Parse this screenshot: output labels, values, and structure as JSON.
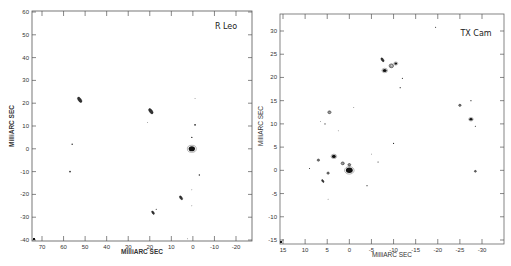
{
  "chart_data": [
    {
      "type": "scatter",
      "title": "R Leo",
      "xlabel": "MilliARC SEC",
      "ylabel": "MilliARC SEC",
      "xlim": [
        75,
        -27
      ],
      "ylim": [
        -41,
        61
      ],
      "xticks": [
        70,
        60,
        50,
        40,
        30,
        20,
        10,
        0,
        -10,
        -20
      ],
      "yticks": [
        60,
        50,
        40,
        30,
        20,
        10,
        0,
        -10,
        -20,
        -30,
        -40
      ],
      "grid": false,
      "legend": null,
      "features": [
        {
          "x": 52.5,
          "y": 21.5,
          "size": 2.2,
          "shape": "elongated"
        },
        {
          "x": 19.5,
          "y": 16.5,
          "size": 2.2,
          "shape": "elongated"
        },
        {
          "x": 0.5,
          "y": 0,
          "size": 3.2,
          "shape": "blob"
        },
        {
          "x": -1,
          "y": 10.5,
          "size": 1.2,
          "shape": "dot"
        },
        {
          "x": 0.5,
          "y": 5,
          "size": 1.0,
          "shape": "dot"
        },
        {
          "x": -3,
          "y": -11.5,
          "size": 1.0,
          "shape": "dot"
        },
        {
          "x": 56,
          "y": 2,
          "size": 1.0,
          "shape": "dot"
        },
        {
          "x": 57,
          "y": -10,
          "size": 1.2,
          "shape": "dot"
        },
        {
          "x": 5.5,
          "y": -21.5,
          "size": 1.6,
          "shape": "elongated"
        },
        {
          "x": 18.5,
          "y": -28,
          "size": 1.4,
          "shape": "elongated"
        },
        {
          "x": 17,
          "y": -26.5,
          "size": 0.8,
          "shape": "dot"
        },
        {
          "x": -1,
          "y": 22,
          "size": 0.6,
          "shape": "dot"
        },
        {
          "x": 0.5,
          "y": -18,
          "size": 0.6,
          "shape": "dot"
        },
        {
          "x": 0.5,
          "y": -25,
          "size": 0.6,
          "shape": "dot"
        },
        {
          "x": 2.5,
          "y": -39.5,
          "size": 0.6,
          "shape": "dot"
        },
        {
          "x": 21,
          "y": 11.5,
          "size": 0.6,
          "shape": "dot"
        }
      ]
    },
    {
      "type": "scatter",
      "title": "TX Cam",
      "xlabel": "MilliARC SEC",
      "ylabel": "MilliARC SEC",
      "xlim": [
        15.5,
        -35
      ],
      "ylim": [
        -16,
        34
      ],
      "xticks": [
        15,
        10,
        5,
        0,
        -5,
        -10,
        -15,
        -20,
        -25,
        -30
      ],
      "yticks": [
        30,
        25,
        20,
        15,
        10,
        5,
        0,
        -5,
        -10,
        -15
      ],
      "grid": false,
      "legend": null,
      "features": [
        {
          "x": -9.5,
          "y": 22.5,
          "size": 2.2,
          "shape": "ring"
        },
        {
          "x": -8,
          "y": 21.5,
          "size": 2.0,
          "shape": "blob"
        },
        {
          "x": -7.5,
          "y": 23.8,
          "size": 1.6,
          "shape": "elongated"
        },
        {
          "x": -10.5,
          "y": 23,
          "size": 1.4,
          "shape": "blob"
        },
        {
          "x": -12,
          "y": 19.8,
          "size": 0.8,
          "shape": "dot"
        },
        {
          "x": -11.5,
          "y": 17.8,
          "size": 0.8,
          "shape": "dot"
        },
        {
          "x": -19.5,
          "y": 30.8,
          "size": 0.8,
          "shape": "dot"
        },
        {
          "x": 4.5,
          "y": 12.5,
          "size": 1.6,
          "shape": "ring"
        },
        {
          "x": 5.5,
          "y": 10,
          "size": 0.8,
          "shape": "dot"
        },
        {
          "x": 6.5,
          "y": 10.5,
          "size": 0.6,
          "shape": "dot"
        },
        {
          "x": -27.5,
          "y": 11,
          "size": 1.6,
          "shape": "blob"
        },
        {
          "x": -25,
          "y": 14,
          "size": 1.2,
          "shape": "ring"
        },
        {
          "x": -27.5,
          "y": 15,
          "size": 0.8,
          "shape": "dot"
        },
        {
          "x": -28.5,
          "y": 9.5,
          "size": 0.8,
          "shape": "dot"
        },
        {
          "x": 0,
          "y": 0,
          "size": 3.4,
          "shape": "blob"
        },
        {
          "x": 3.5,
          "y": 3,
          "size": 2.0,
          "shape": "blob"
        },
        {
          "x": 1.5,
          "y": 1.5,
          "size": 1.6,
          "shape": "ring"
        },
        {
          "x": 0,
          "y": 1.2,
          "size": 1.4,
          "shape": "ring"
        },
        {
          "x": 7,
          "y": 2.2,
          "size": 1.2,
          "shape": "ring"
        },
        {
          "x": 4.8,
          "y": -0.6,
          "size": 1.2,
          "shape": "ring"
        },
        {
          "x": 6,
          "y": -2.3,
          "size": 1.2,
          "shape": "elongated"
        },
        {
          "x": 9,
          "y": 0.4,
          "size": 0.8,
          "shape": "dot"
        },
        {
          "x": -4,
          "y": -3.3,
          "size": 0.8,
          "shape": "dot"
        },
        {
          "x": -6.5,
          "y": 1.8,
          "size": 0.8,
          "shape": "dot"
        },
        {
          "x": -10,
          "y": 5.8,
          "size": 0.8,
          "shape": "dot"
        },
        {
          "x": -28.5,
          "y": -0.2,
          "size": 1.0,
          "shape": "ring"
        },
        {
          "x": -5,
          "y": 3.5,
          "size": 0.6,
          "shape": "dot"
        },
        {
          "x": 4.8,
          "y": -6.2,
          "size": 0.6,
          "shape": "dot"
        },
        {
          "x": 2.5,
          "y": 8.5,
          "size": 0.6,
          "shape": "dot"
        },
        {
          "x": -1,
          "y": 13.5,
          "size": 0.6,
          "shape": "dot"
        }
      ]
    }
  ],
  "panels": [
    {
      "title": "R Leo",
      "xlabel": "MilliARC SEC",
      "ylabel": "MilliARC SEC",
      "xtick_labels": [
        "70",
        "60",
        "50",
        "40",
        "30",
        "20",
        "10",
        "0",
        "-10",
        "-20"
      ],
      "ytick_labels": [
        "60",
        "50",
        "40",
        "30",
        "20",
        "10",
        "0",
        "-10",
        "-20",
        "-30",
        "-40"
      ]
    },
    {
      "title": "TX Cam",
      "xlabel": "MilliARC SEC",
      "ylabel": "MilliARC SEC",
      "xtick_labels": [
        "15",
        "10",
        "5",
        "0",
        "-5",
        "-10",
        "-15",
        "-20",
        "-25",
        "-30"
      ],
      "ytick_labels": [
        "30",
        "25",
        "20",
        "15",
        "10",
        "5",
        "0",
        "-5",
        "-10",
        "-15"
      ]
    }
  ],
  "colors": {
    "frame": "#555555",
    "ink": "#111111",
    "background": "#ffffff"
  }
}
